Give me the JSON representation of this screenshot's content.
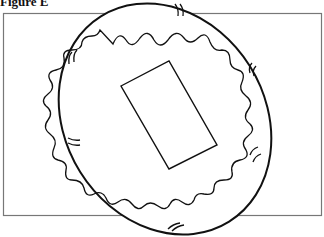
{
  "figure": {
    "title": "Figure E",
    "colors": {
      "stroke": "#111111",
      "frame": "#666666",
      "background": "#ffffff"
    },
    "shapes": {
      "frame": "rectangle",
      "outer": "tilted ellipse with tick marks",
      "middle": "wavy ring",
      "inner": "rotated rectangle"
    }
  }
}
